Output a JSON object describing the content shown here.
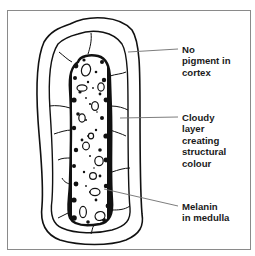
{
  "diagram": {
    "colors": {
      "ink": "#111111",
      "leader": "#6e6e6e",
      "frame": "#8a8a8a",
      "background": "#ffffff"
    },
    "labels": [
      {
        "id": "cortex",
        "lines": [
          "No",
          "pigment in",
          "cortex"
        ]
      },
      {
        "id": "cloudy-layer",
        "lines": [
          "Cloudy",
          "layer",
          "creating",
          "structural",
          "colour"
        ]
      },
      {
        "id": "medulla",
        "lines": [
          "Melanin",
          "in medulla"
        ]
      }
    ]
  }
}
